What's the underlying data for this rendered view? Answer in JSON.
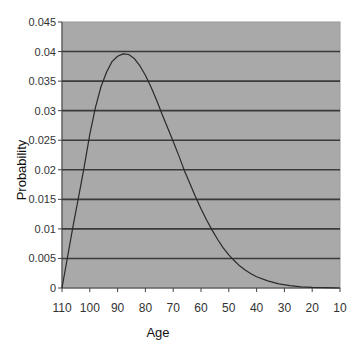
{
  "chart_data": {
    "type": "line",
    "title": "",
    "xlabel": "Age",
    "ylabel": "Probability",
    "x_reversed": true,
    "xlim": [
      110,
      10
    ],
    "ylim": [
      0,
      0.045
    ],
    "grid": {
      "horizontal": true,
      "vertical": false
    },
    "legend": null,
    "x_ticks": [
      "110",
      "100",
      "90",
      "80",
      "70",
      "60",
      "50",
      "40",
      "30",
      "20",
      "10"
    ],
    "y_ticks": [
      "0",
      "0.005",
      "0.01",
      "0.015",
      "0.02",
      "0.025",
      "0.03",
      "0.035",
      "0.04",
      "0.045"
    ],
    "series": [
      {
        "name": "Probability",
        "x": [
          110,
          108,
          106,
          104,
          102,
          100,
          98,
          96,
          94,
          92,
          90,
          88,
          86,
          84,
          82,
          80,
          78,
          76,
          74,
          72,
          70,
          68,
          66,
          64,
          62,
          60,
          58,
          56,
          54,
          52,
          50,
          48,
          46,
          44,
          42,
          40,
          36,
          32,
          28,
          24,
          20,
          16,
          12,
          10
        ],
        "values": [
          0,
          0.0053,
          0.0105,
          0.0155,
          0.0205,
          0.026,
          0.0305,
          0.034,
          0.0365,
          0.0383,
          0.0392,
          0.0396,
          0.0395,
          0.0388,
          0.0376,
          0.036,
          0.034,
          0.0318,
          0.0294,
          0.0271,
          0.0248,
          0.0224,
          0.0199,
          0.0177,
          0.0155,
          0.0134,
          0.0115,
          0.0098,
          0.0082,
          0.0068,
          0.0056,
          0.0046,
          0.0037,
          0.003,
          0.0024,
          0.0019,
          0.0012,
          0.0007,
          0.0004,
          0.0002,
          0.0001,
          5e-05,
          2e-05,
          0.0
        ]
      }
    ],
    "colors": {
      "plot_background": "#a9a9a9",
      "gridline": "#3a3a3a",
      "line": "#2a2a2a",
      "axis": "#444444"
    }
  }
}
